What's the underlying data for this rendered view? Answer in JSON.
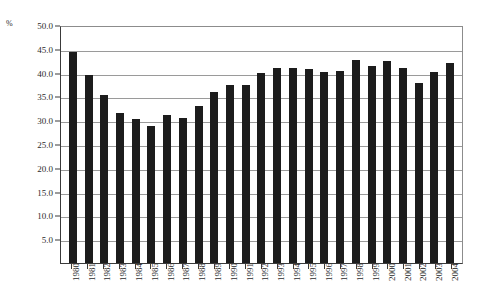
{
  "chart_data": {
    "type": "bar",
    "title": "",
    "subtitle": "",
    "xlabel": "",
    "ylabel": "%",
    "unit_label": "%",
    "legend": [],
    "legend_position": "none",
    "grid": true,
    "grid_axis": "y",
    "ylim": [
      0,
      50
    ],
    "ytick_step": 5,
    "ytick_labels": [
      "50.0",
      "45.0",
      "40.0",
      "35.0",
      "30.0",
      "25.0",
      "20.0",
      "15.0",
      "10.0",
      "5.0"
    ],
    "ytick_values": [
      50.0,
      45.0,
      40.0,
      35.0,
      30.0,
      25.0,
      20.0,
      15.0,
      10.0,
      5.0
    ],
    "categories": [
      "1980",
      "1981",
      "1982",
      "1983",
      "1984",
      "1985",
      "1986",
      "1987",
      "1988",
      "1989",
      "1990",
      "1991",
      "1992",
      "1993",
      "1994",
      "1995",
      "1996",
      "1997",
      "1998",
      "1999",
      "2000",
      "2001",
      "2002",
      "2003",
      "2004"
    ],
    "values": [
      44.4,
      39.6,
      35.2,
      31.6,
      30.3,
      28.8,
      31.0,
      30.5,
      32.9,
      35.9,
      37.3,
      37.5,
      39.9,
      41.0,
      41.0,
      40.7,
      40.2,
      40.4,
      42.6,
      41.3,
      42.4,
      41.0,
      37.9,
      40.1,
      42.0
    ],
    "bar_color": "#1c1c1c",
    "grid_color": "#9a9a9a",
    "axis_color": "#3a3a3a",
    "background_color": "#ffffff"
  }
}
